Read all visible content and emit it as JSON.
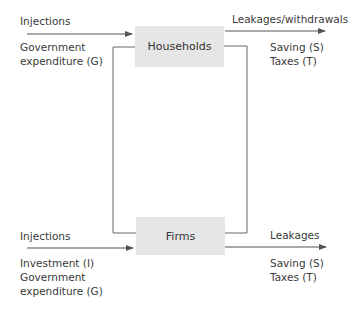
{
  "nodes": {
    "households": "Households",
    "firms": "Firms"
  },
  "top": {
    "injections_label": "Injections",
    "injections_items": [
      "Government",
      "expenditure (G)"
    ],
    "leakages_label": "Leakages/withdrawals",
    "leakages_items": [
      "Saving (S)",
      "Taxes (T)"
    ]
  },
  "bottom": {
    "injections_label": "Injections",
    "injections_items": [
      "Investment (I)",
      "Government",
      "expenditure (G)"
    ],
    "leakages_label": "Leakages",
    "leakages_items": [
      "Saving (S)",
      "Taxes (T)"
    ]
  },
  "colors": {
    "box_fill": "#e6e6e6",
    "line": "#555555",
    "text": "#3a3a3a"
  }
}
